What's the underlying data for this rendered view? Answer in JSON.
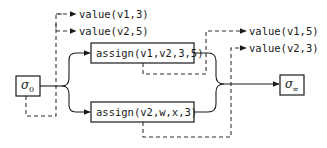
{
  "diagram": {
    "type": "state-transition",
    "initial_state": {
      "symbol": "σ",
      "subscript": "0"
    },
    "final_state": {
      "symbol": "σ",
      "subscript": "∞"
    },
    "actions": [
      {
        "label": "assign(v1,v2,3,5)"
      },
      {
        "label": "assign(v2,w,x,3)"
      }
    ],
    "initial_observations": [
      {
        "label": "value(v1,3)"
      },
      {
        "label": "value(v2,5)"
      }
    ],
    "final_observations": [
      {
        "label": "value(v1,5)"
      },
      {
        "label": "value(v2,3)"
      }
    ],
    "legend": {
      "solid_arrow": "transition",
      "dashed_arrow": "observation"
    },
    "colors": {
      "line": "#1a1a1a",
      "background": "#ffffff"
    }
  }
}
